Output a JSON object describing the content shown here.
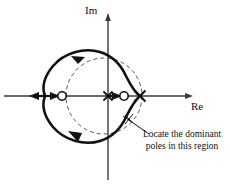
{
  "figure": {
    "background_color": "#ffffff",
    "stroke_color": "#111111",
    "axis_color": "#3a3a3a",
    "dash_color": "#555555"
  },
  "axes": {
    "imaginary": {
      "label": "Im",
      "orientation": "vertical",
      "x": 108,
      "arrow": "up",
      "from_y": 178,
      "to_y": 15
    },
    "real": {
      "label": "Re",
      "orientation": "horizontal",
      "y": 96,
      "arrow": "right",
      "from_x": 5,
      "to_x": 192
    },
    "origin": {
      "x": 108,
      "y": 96
    }
  },
  "markers": {
    "zeros": [
      {
        "name": "zero-left",
        "symbol": "open-circle",
        "x": 62,
        "y": 96,
        "radius": 4.2
      },
      {
        "name": "zero-right",
        "symbol": "open-circle",
        "x": 124,
        "y": 96,
        "radius": 4.2
      }
    ],
    "poles": [
      {
        "name": "pole-origin",
        "symbol": "cross",
        "x": 108,
        "y": 96,
        "size": 5
      },
      {
        "name": "pole-right",
        "symbol": "cross",
        "x": 140,
        "y": 96,
        "size": 6
      }
    ]
  },
  "locus": {
    "type": "closed-curve",
    "style": "solid-bold",
    "stroke_width": 2.6,
    "direction_arrows": [
      {
        "name": "locus-arrow-upper-left",
        "x": 78,
        "y": 58,
        "angle": 200
      },
      {
        "name": "locus-arrow-lower-left",
        "x": 78,
        "y": 135,
        "angle": 340
      }
    ]
  },
  "guide_circle": {
    "type": "dashed-circle",
    "center_x": 104,
    "center_y": 96,
    "radius": 38,
    "dash": "4 3",
    "stroke_width": 1
  },
  "axis_direction_arrows": [
    {
      "name": "real-axis-arrow-left",
      "x": 38,
      "y": 96,
      "direction": "left"
    },
    {
      "name": "real-axis-arrow-inner-left",
      "x": 55,
      "y": 96,
      "direction": "right"
    },
    {
      "name": "real-axis-arrow-inner-right",
      "x": 121,
      "y": 96,
      "direction": "right"
    }
  ],
  "annotation": {
    "line1": "Locate the dominant",
    "line2": "poles in this region",
    "pointer": {
      "from_x": 148,
      "from_y": 133,
      "to_x": 124,
      "to_y": 117,
      "tick_marker": "x"
    }
  }
}
